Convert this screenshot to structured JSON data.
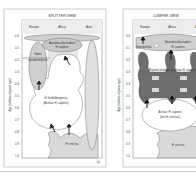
{
  "figure": {
    "left_panel": {
      "title": "SPLITTER VIEW",
      "regions": [
        "Europe",
        "Africa",
        "Asia"
      ],
      "y_axis_label": "Age (millions of years ago)",
      "y_ticks": [
        "0.0",
        "0.1",
        "0.2",
        "0.3",
        "0.4",
        "0.5",
        "0.6",
        "0.7",
        "0.8",
        "0.9",
        "1.0"
      ],
      "labels": {
        "modern": "Anatomically modern",
        "modern2": "H. sapiens",
        "neanderthal": "Homo",
        "neanderthal2": "neanderthalensis",
        "heidel": "H. heidelbergensis",
        "heidel2": "(Archaic H. sapiens)",
        "erectus": "H. erectus"
      },
      "panel_tag": "(a)"
    },
    "right_panel": {
      "title": "LUMPER VIEW",
      "regions": [
        "Europe",
        "Africa",
        "Asia"
      ],
      "y_axis_label": "Age (millions of years ago)",
      "y_ticks": [
        "0.0",
        "0.1",
        "0.2",
        "0.3",
        "0.4",
        "0.5",
        "0.6",
        "0.7",
        "0.8",
        "0.9",
        "1.0"
      ],
      "labels": {
        "neanderthals": "Neanderthals",
        "modern": "Anatomically modern",
        "modern2": "H. sapiens",
        "regional": "Regional evolution of archaic H. sapiens",
        "archaic": "Archaic H. sapiens",
        "archaic2": "(late H. erectus)",
        "erectus": "H. erectus"
      }
    },
    "colors": {
      "light_gray": "#d9d9d9",
      "mid_gray": "#bdbdbd",
      "dark_gray": "#6e6e6e",
      "white": "#ffffff",
      "border": "#999999"
    }
  }
}
